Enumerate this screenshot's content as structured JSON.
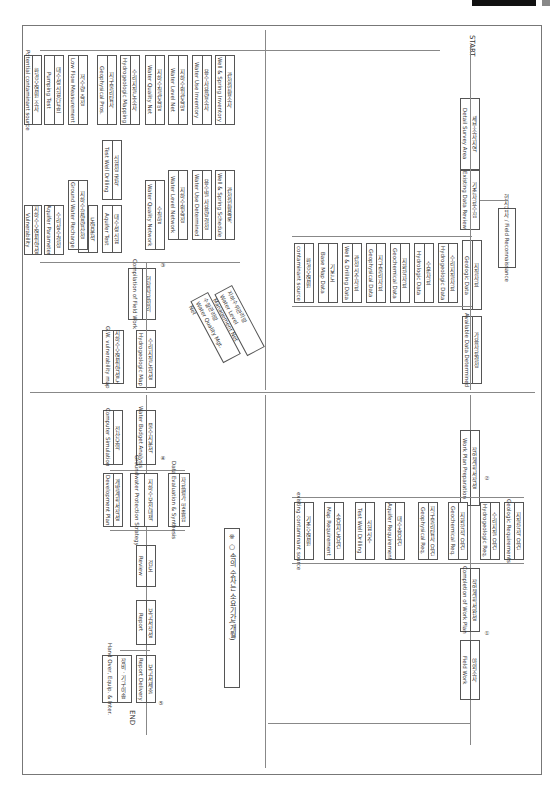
{
  "header": {
    "tag": "Groundwater"
  },
  "flow": {
    "start": "START",
    "end": "END",
    "main": [
      {
        "ko": "세부조사지역",
        "en": "Detail Survey Area"
      },
      {
        "ko": "기존자료수집",
        "en": "Existing Data Review"
      },
      {
        "ko": "지질자료",
        "en": "Geologic Data"
      },
      {
        "ko": "가용자료결정",
        "en": "Available Data Determined"
      }
    ],
    "field_recon": "현지답사 / Field Reconnaissance",
    "data_items": [
      {
        "ko": "수리지질자료",
        "en": "Hydrogeologic Data"
      },
      {
        "ko": "수문자료",
        "en": "Hydrologic Data"
      },
      {
        "ko": "지화학자료",
        "en": "Geochemical Data"
      },
      {
        "ko": "지구물리자료",
        "en": "Geophysical Data"
      },
      {
        "ko": "관정시추자료",
        "en": "Well & Drilling Data"
      },
      {
        "ko": "기본도",
        "en": "Base Map Data"
      },
      {
        "ko": "환경오염원",
        "en": "contaminant source"
      }
    ],
    "work_plan": [
      {
        "ko": "작업계획서작성",
        "en": "Work Plan Preparation",
        "marker": "②"
      },
      {
        "ko": "작업계획서완성",
        "en": "Completion of Work Plan",
        "marker": "①"
      },
      {
        "ko": "야외조사",
        "en": "Field Work"
      }
    ],
    "requirements": [
      {
        "ko": "지질학적 요건",
        "en": "Geologic Requirements"
      },
      {
        "ko": "수리지질 요건",
        "en": "Hydrogeologic Req."
      },
      {
        "ko": "지화학적 요건",
        "en": "Geochemical Req."
      },
      {
        "ko": "지구물리탐사 요건",
        "en": "Geophysical Req."
      },
      {
        "ko": "대수층요건",
        "en": "Aquifer Requirement"
      },
      {
        "ko": "시험시추",
        "en": "Test Well Drilling"
      },
      {
        "ko": "소요지도요건",
        "en": "Map Requirement"
      },
      {
        "ko": "기존오염원",
        "en": "existing contaminant source"
      }
    ],
    "surveys": [
      {
        "ko": "관정현황조사",
        "en": "Well & Spring Inventory"
      },
      {
        "ko": "용수사용량조사",
        "en": "Water Use Inventory"
      },
      {
        "ko": "지하수위관측망",
        "en": "Water Level Net"
      },
      {
        "ko": "지하수질관측망",
        "en": "Water Quality Net"
      },
      {
        "ko": "수리지질도조사",
        "en": "Hydrogeologic Mapping"
      },
      {
        "ko": "지구물리탐사",
        "en": "Geophysical Pros."
      },
      {
        "ko": "저수량 측정",
        "en": "Low Flow Measurement"
      },
      {
        "ko": "대수성시험(단공)",
        "en": "Pumping Test"
      },
      {
        "ko": "환경오염원 조사",
        "en": "Potential contaminant source"
      }
    ],
    "survey_results": [
      {
        "ko": "관정현황목록",
        "en": "Well & Spring Schedule"
      },
      {
        "ko": "용수별 사용량 결정",
        "en": "Water Use Determined"
      },
      {
        "ko": "지하수위측정",
        "en": "Water Level Network"
      },
      {
        "ko": "수질망",
        "en": "Water Quality Network"
      },
      {
        "ko": "시험정 굴착",
        "en": "Test Well Drilling"
      },
      {
        "ko": "대수성시험",
        "en": "Aquifer Test"
      },
      {
        "ko": "토양분석",
        "en": "Soil Analysis"
      },
      {
        "ko": "지하수함양량산정",
        "en": "Ground Water Recharge"
      },
      {
        "ko": "수리상수결정",
        "en": "Aquifer Parameter"
      },
      {
        "ko": "지하수오염취약성",
        "en": "Vulnerability"
      }
    ],
    "networks": [
      {
        "ko": "지하수위관리망",
        "en": "Water Level Management Net"
      },
      {
        "ko": "수질관리망",
        "en": "Water Quality Mgt. Net"
      }
    ],
    "compile": [
      {
        "ko": "현장자료정리",
        "en": "Compilation of Field Work",
        "marker": "③"
      },
      {
        "ko": "수리지질도작성",
        "en": "Hydrogeologic Map"
      },
      {
        "ko": "지하수오염취약성도",
        "en": "G.W. vulnerability map"
      },
      {
        "ko": "물수지분석",
        "en": "Water Budget Analysis",
        "marker": "④"
      },
      {
        "ko": "전산모의",
        "en": "Computer Simulation"
      }
    ],
    "evaluation": [
      {
        "ko": "자료평가 및 종합",
        "en": "Data Evaluation & Synthesis"
      },
      {
        "ko": "지하수보전대책",
        "en": "Groundwater Protection Strategy"
      },
      {
        "ko": "개발계획서작성",
        "en": "Development Plan"
      }
    ],
    "report": [
      {
        "ko": "검토",
        "en": "Review"
      },
      {
        "ko": "보고서작성",
        "en": "Report"
      },
      {
        "ko": "보고서제출",
        "en": "Report Delivery",
        "marker": "⑤"
      },
      {
        "ko": "장비 · 기구이송",
        "en": "Hand Over, Equip. & Inter."
      }
    ],
    "legend": "※ ○ 속의 숫자는 소요기간(개월)"
  }
}
